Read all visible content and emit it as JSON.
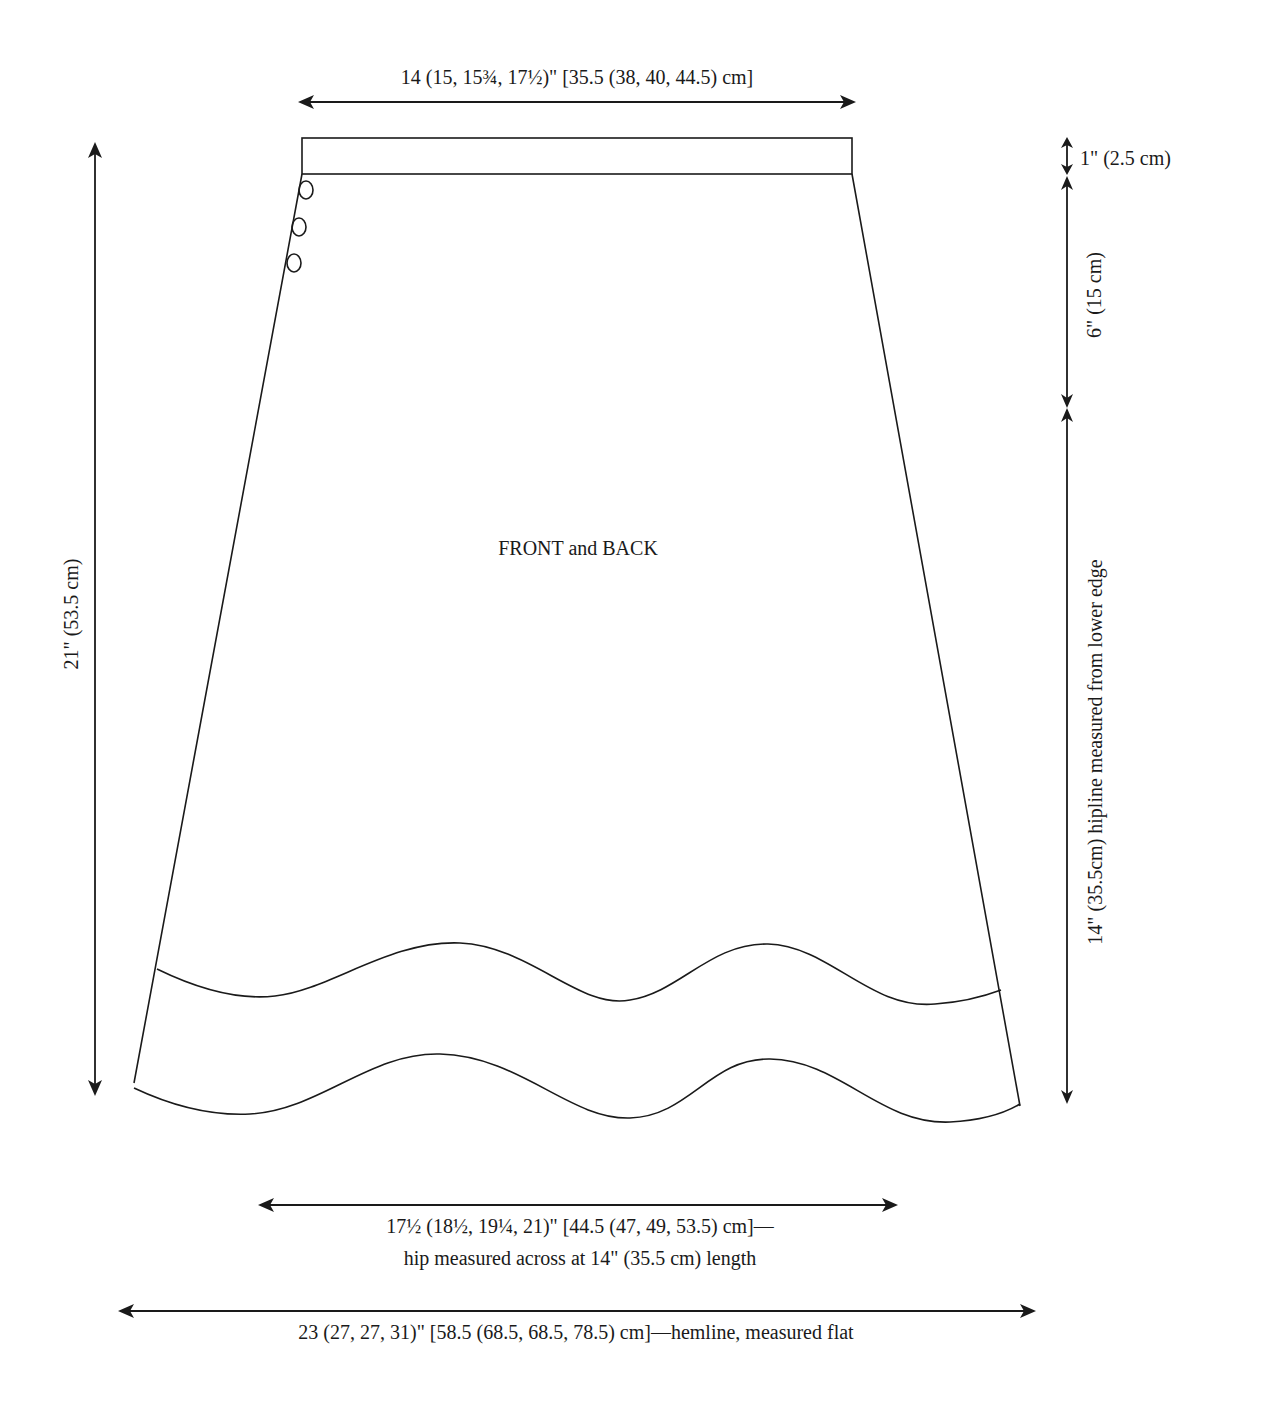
{
  "diagram": {
    "title": "FRONT and BACK",
    "piece_label": "FRONT and BACK",
    "stroke_color": "#1a1a1a",
    "background": "#ffffff",
    "measurements": {
      "waist_width": "14 (15, 15¾, 17½)\" [35.5 (38, 40, 44.5) cm]",
      "waistband_height": "1\" (2.5 cm)",
      "upper_length": "6\" (15 cm)",
      "hipline_length": "14\" (35.5cm) hipline measured from lower edge",
      "total_length": "21\" (53.5 cm)",
      "hip_width_line1": "17½ (18½, 19¼, 21)\" [44.5 (47, 49, 53.5) cm]—",
      "hip_width_line2": "hip measured across at 14\" (35.5 cm) length",
      "hem_width": "23 (27, 27, 31)\" [58.5 (68.5, 68.5, 78.5) cm]—hemline, measured flat"
    },
    "features": {
      "buttons": 3,
      "waistband": true,
      "wavy_border_bands": 2
    }
  }
}
